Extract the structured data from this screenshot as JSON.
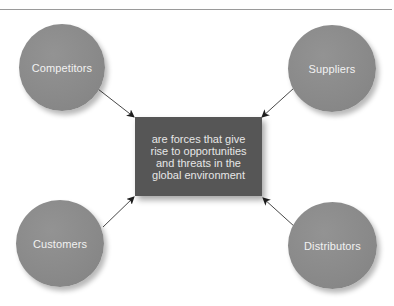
{
  "diagram": {
    "center": {
      "lines": [
        "are forces that give",
        "rise to opportunities",
        "and threats in the",
        "global environment"
      ]
    },
    "nodes": [
      {
        "label": "Competitors",
        "position": "top-left"
      },
      {
        "label": "Suppliers",
        "position": "top-right"
      },
      {
        "label": "Customers",
        "position": "bottom-left"
      },
      {
        "label": "Distributors",
        "position": "bottom-right"
      }
    ],
    "arrows": [
      {
        "from": "Competitors",
        "to": "center"
      },
      {
        "from": "Suppliers",
        "to": "center"
      },
      {
        "from": "Customers",
        "to": "center"
      },
      {
        "from": "Distributors",
        "to": "center"
      }
    ],
    "colors": {
      "circle": "#8a8a8a",
      "box": "#565656",
      "text_light": "#f2f2f2",
      "arrow": "#222222",
      "rule": "#9a9a9a"
    }
  }
}
